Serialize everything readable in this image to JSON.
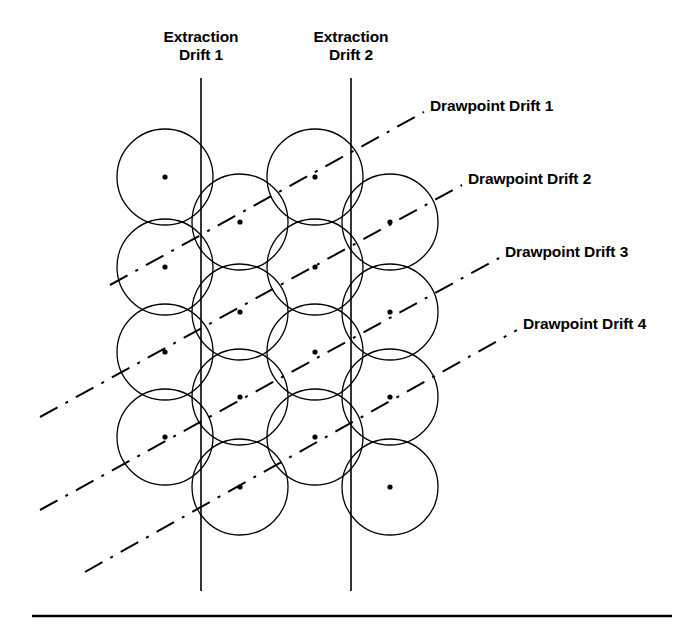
{
  "figure": {
    "background_color": "#ffffff",
    "line_color": "#000000",
    "width": 696,
    "height": 631
  },
  "extraction_drifts": [
    {
      "id": "extraction-drift-1",
      "line1": "Extraction",
      "line2": "Drift 1",
      "label_center_x": 201,
      "label_top_y": 28,
      "line_x": 201,
      "line_y_start": 78,
      "line_y_end": 591
    },
    {
      "id": "extraction-drift-2",
      "line1": "Extraction",
      "line2": "Drift 2",
      "label_center_x": 351,
      "label_top_y": 28,
      "line_x": 351,
      "line_y_start": 78,
      "line_y_end": 591
    }
  ],
  "drawpoint_drifts": [
    {
      "id": "drawpoint-drift-1",
      "label": "Drawpoint Drift 1",
      "label_x": 430,
      "label_y": 97,
      "leader_x1": 424,
      "leader_y1": 112,
      "x1": 110,
      "y1": 285,
      "x2": 424,
      "y2": 112
    },
    {
      "id": "drawpoint-drift-2",
      "label": "Drawpoint Drift 2",
      "label_x": 468,
      "label_y": 170,
      "leader_x1": 462,
      "leader_y1": 185,
      "x1": 40,
      "y1": 417,
      "x2": 462,
      "y2": 185
    },
    {
      "id": "drawpoint-drift-3",
      "label": "Drawpoint Drift 3",
      "label_x": 505,
      "label_y": 243,
      "leader_x1": 499,
      "leader_y1": 258,
      "x1": 40,
      "y1": 510,
      "x2": 499,
      "y2": 258
    },
    {
      "id": "drawpoint-drift-4",
      "label": "Drawpoint Drift 4",
      "label_x": 523,
      "label_y": 315,
      "leader_x1": 517,
      "leader_y1": 330,
      "x1": 85,
      "y1": 572,
      "x2": 517,
      "y2": 330
    }
  ],
  "draw_circles": {
    "radius": 48,
    "centers": [
      {
        "x": 165,
        "y": 177
      },
      {
        "x": 315,
        "y": 177
      },
      {
        "x": 240,
        "y": 222
      },
      {
        "x": 390,
        "y": 222
      },
      {
        "x": 165,
        "y": 267
      },
      {
        "x": 315,
        "y": 267
      },
      {
        "x": 240,
        "y": 312
      },
      {
        "x": 390,
        "y": 312
      },
      {
        "x": 165,
        "y": 352
      },
      {
        "x": 315,
        "y": 352
      },
      {
        "x": 240,
        "y": 397
      },
      {
        "x": 390,
        "y": 397
      },
      {
        "x": 165,
        "y": 437
      },
      {
        "x": 315,
        "y": 437
      },
      {
        "x": 240,
        "y": 487
      },
      {
        "x": 390,
        "y": 487
      }
    ]
  },
  "draw_points": [
    {
      "x": 165,
      "y": 177
    },
    {
      "x": 315,
      "y": 177
    },
    {
      "x": 240,
      "y": 222
    },
    {
      "x": 390,
      "y": 222
    },
    {
      "x": 165,
      "y": 267
    },
    {
      "x": 315,
      "y": 267
    },
    {
      "x": 240,
      "y": 312
    },
    {
      "x": 390,
      "y": 312
    },
    {
      "x": 165,
      "y": 352
    },
    {
      "x": 315,
      "y": 352
    },
    {
      "x": 240,
      "y": 397
    },
    {
      "x": 390,
      "y": 397
    },
    {
      "x": 165,
      "y": 437
    },
    {
      "x": 315,
      "y": 437
    },
    {
      "x": 240,
      "y": 487
    },
    {
      "x": 390,
      "y": 487
    }
  ],
  "footer_rule": {
    "x1": 32,
    "x2": 672,
    "y": 616,
    "thickness": 2.5
  }
}
